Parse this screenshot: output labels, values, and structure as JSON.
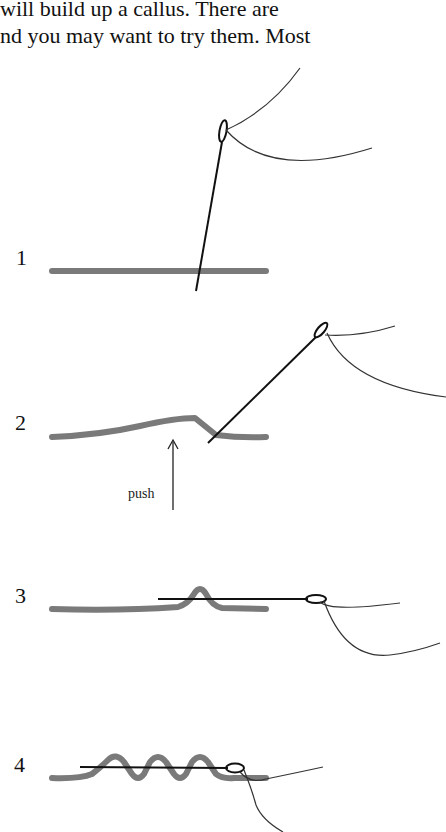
{
  "text": {
    "lines": [
      "will build up a callus. There are",
      "nd you may want to try them. Most"
    ]
  },
  "figure": {
    "steps": [
      {
        "number": "1",
        "label": ""
      },
      {
        "number": "2",
        "label": "push"
      },
      {
        "number": "3",
        "label": ""
      },
      {
        "number": "4",
        "label": ""
      }
    ],
    "colors": {
      "fabric": "#7a7a7a",
      "needle": "#111111",
      "thread": "#333333",
      "text": "#111111"
    }
  }
}
